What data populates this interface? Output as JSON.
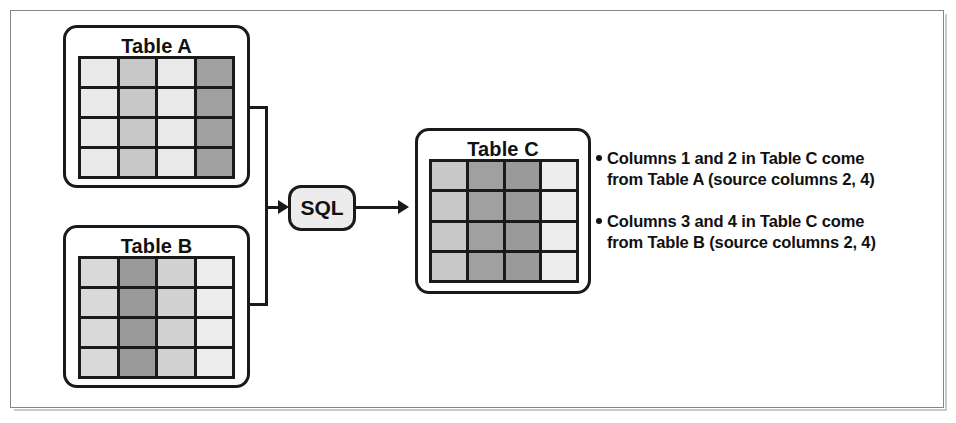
{
  "diagram": {
    "title_a": "Table A",
    "title_b": "Table B",
    "title_c": "Table C",
    "process_label": "SQL",
    "colors": {
      "outline": "#1a1a1a",
      "frame": "#868686",
      "sql_fill": "#ececec",
      "background": "#ffffff"
    },
    "tables": [
      {
        "id": "table-a",
        "name": "Table A",
        "rows": 4,
        "columns": 4,
        "column_shades": [
          "#e9e9e9",
          "#c8c8c8",
          "#e9e9e9",
          "#a0a0a0"
        ]
      },
      {
        "id": "table-b",
        "name": "Table B",
        "rows": 4,
        "columns": 4,
        "column_shades": [
          "#d9d9d9",
          "#9a9a9a",
          "#d2d2d2",
          "#ededed"
        ]
      },
      {
        "id": "table-c",
        "name": "Table C",
        "rows": 4,
        "columns": 4,
        "column_shades": [
          "#c8c8c8",
          "#a0a0a0",
          "#9a9a9a",
          "#ededed"
        ]
      }
    ],
    "notes": [
      "Columns 1 and 2 in Table C come from Table A (source columns 2, 4)",
      "Columns 3 and 4 in Table C come from Table B (source columns 2, 4)"
    ]
  }
}
